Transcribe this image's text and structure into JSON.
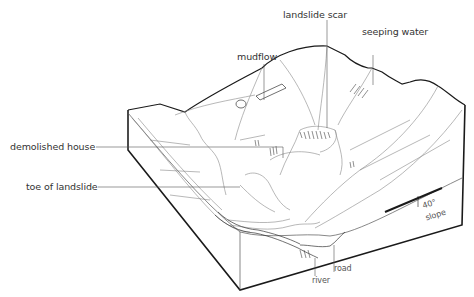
{
  "diagram": {
    "type": "block-diagram",
    "labels": {
      "landslide_scar": "landslide scar",
      "seeping_water_line1": "seeping water",
      "seeping_water_line2": "saturation",
      "mudflow": "mudflow",
      "demolished_house": "demolished house",
      "toe_of_landslide": "toe of  landslide",
      "river": "river",
      "road": "road",
      "slope_angle": "40°",
      "slope": "slope"
    },
    "colors": {
      "ink": "#1a1a1a",
      "fine_line": "#777777",
      "background": "#ffffff"
    }
  }
}
